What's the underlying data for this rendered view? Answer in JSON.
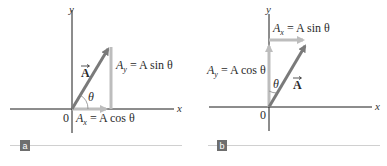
{
  "figure": {
    "colors": {
      "axis": "#1a1a1a",
      "vector": "#7a7a7a",
      "component": "#bdbdbd",
      "text": "#2b2b2b",
      "panel_tag_bg": "#6e6e6e",
      "panel_rule": "#d0d0d0"
    },
    "panels": [
      {
        "tag": "a",
        "axis_x_label": "x",
        "axis_y_label": "y",
        "origin_label": "0",
        "vector_label": "A",
        "angle_label": "θ",
        "x_component": {
          "sym": "A",
          "sub": "x",
          "eq": " = A cos θ"
        },
        "y_component": {
          "sym": "A",
          "sub": "y",
          "eq": " = A sin θ"
        }
      },
      {
        "tag": "b",
        "axis_x_label": "x",
        "axis_y_label": "y",
        "origin_label": "0",
        "vector_label": "A",
        "angle_label": "θ",
        "x_component": {
          "sym": "A",
          "sub": "x",
          "eq": " = A sin θ"
        },
        "y_component": {
          "sym": "A",
          "sub": "y",
          "eq": " = A cos θ"
        }
      }
    ]
  }
}
